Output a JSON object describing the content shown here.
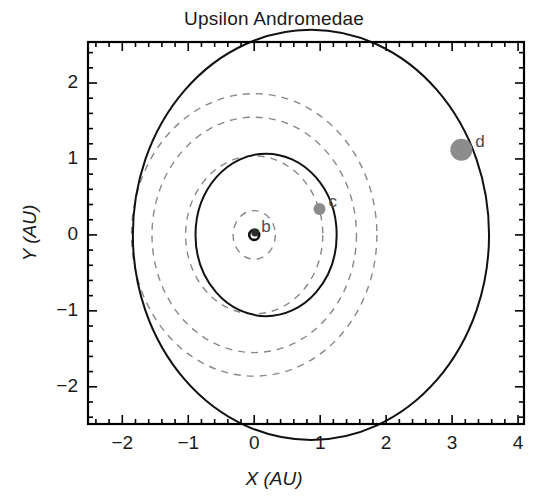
{
  "figure": {
    "title": "Upsilon Andromedae",
    "width": 548,
    "height": 502
  },
  "chart_data": {
    "type": "scatter",
    "title": "Upsilon Andromedae",
    "xlabel": "X (AU)",
    "ylabel": "Y (AU)",
    "xlim": [
      -2.52,
      4.09
    ],
    "ylim": [
      -2.49,
      2.54
    ],
    "xticks": [
      -2,
      -1,
      0,
      1,
      2,
      3,
      4
    ],
    "xticklabels": [
      "−2",
      "−1",
      "0",
      "1",
      "2",
      "3",
      "4"
    ],
    "yticks": [
      -2,
      -1,
      0,
      1,
      2
    ],
    "yticklabels": [
      "−2",
      "−1",
      "0",
      "1",
      "2"
    ],
    "minor_tick_interval": 0.2,
    "grid": false,
    "legend": null,
    "frame": "box-all-sides-inward-ticks",
    "star": {
      "name": "Upsilon Andromedae A",
      "x": 0.0,
      "y": 0.0,
      "marker": "open-circle",
      "radius_px": 5,
      "color": "#111111"
    },
    "planets": [
      {
        "label": "b",
        "x": 0.0,
        "y": 0.03,
        "marker_radius_px": 4,
        "color": "#2b2b2b",
        "orbit": {
          "semi_major_axis_au": 0.059,
          "style": "solid",
          "drawn": false
        },
        "label_offset_px": [
          7,
          -16
        ]
      },
      {
        "label": "c",
        "x": 0.99,
        "y": 0.34,
        "marker_radius_px": 6,
        "color": "#8c8c8c",
        "orbit": {
          "semi_major_axis_au": 0.83,
          "eccentricity": 0.25,
          "style": "solid",
          "color": "#111111",
          "center_x": 0.18,
          "center_y": 0.0,
          "radius_au": 1.07,
          "drawn": true
        },
        "label_offset_px": [
          9,
          -17
        ]
      },
      {
        "label": "d",
        "x": 3.14,
        "y": 1.12,
        "marker_radius_px": 11,
        "color": "#8c8c8c",
        "orbit": {
          "semi_major_axis_au": 2.53,
          "eccentricity": 0.27,
          "style": "solid",
          "color": "#111111",
          "center_x": 0.86,
          "center_y": 0.0,
          "radius_au": 2.7,
          "drawn": true
        },
        "label_offset_px": [
          14,
          -18
        ]
      }
    ],
    "dashed_circles": [
      {
        "name": "inner-dashed-1",
        "center_x": 0.0,
        "center_y": 0.0,
        "radius_au": 0.32,
        "style": "dashed",
        "color": "#888888"
      },
      {
        "name": "inner-dashed-2",
        "center_x": 0.0,
        "center_y": 0.0,
        "radius_au": 1.04,
        "style": "dashed",
        "color": "#888888"
      },
      {
        "name": "inner-dashed-3",
        "center_x": 0.0,
        "center_y": 0.0,
        "radius_au": 1.55,
        "style": "dashed",
        "color": "#888888"
      },
      {
        "name": "inner-dashed-4",
        "center_x": 0.0,
        "center_y": 0.0,
        "radius_au": 1.86,
        "style": "dashed",
        "color": "#888888"
      }
    ],
    "colors": {
      "axis": "#000000",
      "orbit_solid": "#111111",
      "orbit_dashed": "#888888",
      "planet_marker": "#8c8c8c",
      "background": "#ffffff"
    }
  }
}
